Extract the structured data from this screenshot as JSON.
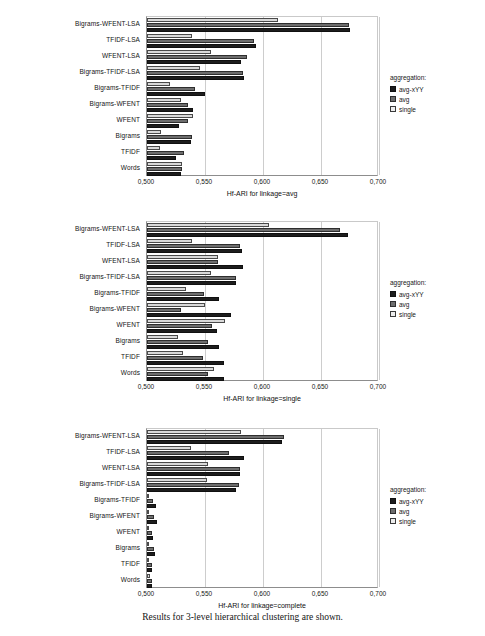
{
  "figure": {
    "caption": "Results for 3-level hierarchical clustering are shown."
  },
  "legend": {
    "title": "aggregation:",
    "entries": [
      {
        "label": "avg-xYY",
        "color": "#1d1d1d"
      },
      {
        "label": "avg",
        "color": "#6d6d6d"
      },
      {
        "label": "single",
        "color": "#ededed"
      }
    ]
  },
  "axis": {
    "ticks": [
      "0,500",
      "0,550",
      "0,600",
      "0,650",
      "0,700"
    ],
    "min": 0.5,
    "max": 0.7
  },
  "categories": [
    "Bigrams-WFENT-LSA",
    "TFIDF-LSA",
    "WFENT-LSA",
    "Bigrams-TFIDF-LSA",
    "Bigrams-TFIDF",
    "Bigrams-WFENT",
    "WFENT",
    "Bigrams",
    "TFIDF",
    "Words"
  ],
  "chart_data": [
    {
      "type": "bar",
      "orientation": "horizontal",
      "title": "",
      "xlabel": "Hf-ARI for linkage=avg",
      "ylabel": "",
      "xlim": [
        0.5,
        0.7
      ],
      "grid": true,
      "legend_position": "right",
      "categories": [
        "Bigrams-WFENT-LSA",
        "TFIDF-LSA",
        "WFENT-LSA",
        "Bigrams-TFIDF-LSA",
        "Bigrams-TFIDF",
        "Bigrams-WFENT",
        "WFENT",
        "Bigrams",
        "TFIDF",
        "Words"
      ],
      "series": [
        {
          "name": "single",
          "values": [
            0.613,
            0.539,
            0.555,
            0.546,
            0.52,
            0.529,
            0.54,
            0.512,
            0.511,
            0.53
          ]
        },
        {
          "name": "avg",
          "values": [
            0.674,
            0.592,
            0.586,
            0.583,
            0.541,
            0.535,
            0.535,
            0.539,
            0.532,
            0.53
          ]
        },
        {
          "name": "avg-xYY",
          "values": [
            0.675,
            0.594,
            0.581,
            0.584,
            0.55,
            0.54,
            0.528,
            0.538,
            0.525,
            0.529
          ]
        }
      ]
    },
    {
      "type": "bar",
      "orientation": "horizontal",
      "title": "",
      "xlabel": "Hf-ARI for linkage=single",
      "ylabel": "",
      "xlim": [
        0.5,
        0.7
      ],
      "grid": true,
      "legend_position": "right",
      "categories": [
        "Bigrams-WFENT-LSA",
        "TFIDF-LSA",
        "WFENT-LSA",
        "Bigrams-TFIDF-LSA",
        "Bigrams-TFIDF",
        "Bigrams-WFENT",
        "WFENT",
        "Bigrams",
        "TFIDF",
        "Words"
      ],
      "series": [
        {
          "name": "single",
          "values": [
            0.605,
            0.539,
            0.561,
            0.555,
            0.534,
            0.55,
            0.567,
            0.527,
            0.531,
            0.558
          ]
        },
        {
          "name": "avg",
          "values": [
            0.666,
            0.58,
            0.561,
            0.577,
            0.549,
            0.529,
            0.556,
            0.553,
            0.548,
            0.553
          ]
        },
        {
          "name": "avg-xYY",
          "values": [
            0.673,
            0.582,
            0.583,
            0.577,
            0.562,
            0.572,
            0.56,
            0.562,
            0.566,
            0.566
          ]
        }
      ]
    },
    {
      "type": "bar",
      "orientation": "horizontal",
      "title": "",
      "xlabel": "Hf-ARI for linkage=complete",
      "ylabel": "",
      "xlim": [
        0.5,
        0.7
      ],
      "grid": true,
      "legend_position": "right",
      "categories": [
        "Bigrams-WFENT-LSA",
        "TFIDF-LSA",
        "WFENT-LSA",
        "Bigrams-TFIDF-LSA",
        "Bigrams-TFIDF",
        "Bigrams-WFENT",
        "WFENT",
        "Bigrams",
        "TFIDF",
        "Words"
      ],
      "series": [
        {
          "name": "single",
          "values": [
            0.581,
            0.538,
            0.553,
            0.552,
            0.502,
            0.502,
            0.502,
            0.502,
            0.502,
            0.503
          ]
        },
        {
          "name": "avg",
          "values": [
            0.618,
            0.571,
            0.58,
            0.579,
            0.505,
            0.506,
            0.504,
            0.506,
            0.504,
            0.504
          ]
        },
        {
          "name": "avg-xYY",
          "values": [
            0.616,
            0.584,
            0.58,
            0.577,
            0.508,
            0.509,
            0.505,
            0.507,
            0.504,
            0.504
          ]
        }
      ]
    }
  ]
}
